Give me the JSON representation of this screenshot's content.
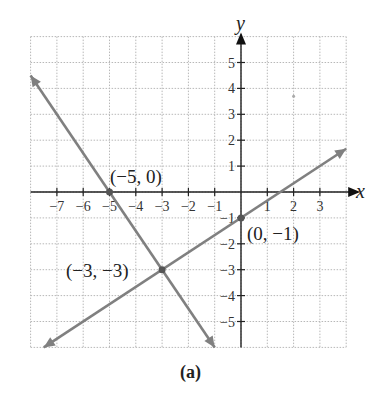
{
  "chart_data": {
    "type": "line",
    "title": "",
    "caption": "(a)",
    "xlabel": "x",
    "ylabel": "y",
    "xlim": [
      -8,
      4
    ],
    "ylim": [
      -6,
      6
    ],
    "grid": true,
    "grid_style": "dotted",
    "x_ticks": [
      -7,
      -6,
      -5,
      -4,
      -3,
      -2,
      -1,
      1,
      2,
      3
    ],
    "x_tick_labels": [
      "−7",
      "−6",
      "−5",
      "−4",
      "−3",
      "−2",
      "−1",
      "1",
      "2",
      "3"
    ],
    "y_ticks": [
      5,
      4,
      3,
      2,
      1,
      -1,
      -2,
      -3,
      -4,
      -5
    ],
    "y_tick_labels": [
      "5",
      "4",
      "3",
      "2",
      "1",
      "−1",
      "−2",
      "−3",
      "−4",
      "−5"
    ],
    "series": [
      {
        "name": "line-1",
        "equation": "y = -1.5x - 7.5",
        "x": [
          -8,
          -1
        ],
        "y": [
          4.5,
          -6
        ],
        "color": "#808080",
        "arrows": "both"
      },
      {
        "name": "line-2",
        "equation": "y = (2/3)x - 1",
        "x": [
          -7.5,
          4
        ],
        "y": [
          -6,
          1.67
        ],
        "color": "#808080",
        "arrows": "both"
      }
    ],
    "points": [
      {
        "x": -5,
        "y": 0,
        "label": "(−5, 0)"
      },
      {
        "x": -3,
        "y": -3,
        "label": "(−3, −3)"
      },
      {
        "x": 0,
        "y": -1,
        "label": "(0, −1)"
      }
    ]
  },
  "labels": {
    "x_axis": "x",
    "y_axis": "y",
    "caption": "(a)",
    "point_a": "(−5, 0)",
    "point_b": "(−3, −3)",
    "point_c": "(0, −1)"
  }
}
